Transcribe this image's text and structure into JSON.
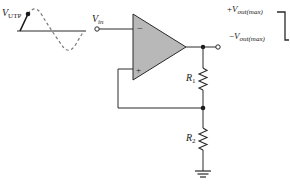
{
  "diagram": {
    "input_waveform": {
      "label_main": "V",
      "label_sub": "UTP",
      "description": "sine wave with point marked at upper trip point"
    },
    "input": {
      "label_main": "V",
      "label_sub": "in"
    },
    "opamp": {
      "inverting_symbol": "−",
      "noninverting_symbol": "+",
      "fill_color": "#b8b8b8"
    },
    "resistors": [
      {
        "label_main": "R",
        "label_sub": "1"
      },
      {
        "label_main": "R",
        "label_sub": "2"
      }
    ],
    "output_waveform": {
      "high_sign": "+",
      "high_main": "V",
      "high_sub": "out(max)",
      "low_sign": "−",
      "low_main": "V",
      "low_sub": "out(max)"
    },
    "colors": {
      "wire": "#2a2a2a",
      "dashed_wave": "#7a7a7a",
      "opamp_fill": "#b8b8b8",
      "background": "#ffffff"
    }
  }
}
